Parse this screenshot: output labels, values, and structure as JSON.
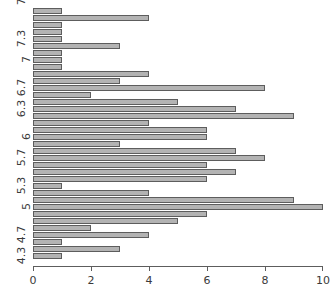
{
  "chart_data": {
    "type": "bar",
    "orientation": "horizontal",
    "title": "",
    "subtitle": "",
    "xlabel": "",
    "ylabel": "",
    "xlim": [
      0,
      10
    ],
    "ylim_labels": [
      "4.3",
      "4.7",
      "5",
      "5.3",
      "5.7",
      "6",
      "6.3",
      "6.7",
      "7",
      "7.3",
      "7.9"
    ],
    "grid": false,
    "legend": null,
    "bar_color": "#b3b3b3",
    "bar_border_color": "#5d5d5d",
    "axis_color": "#5d5d5d",
    "text_color": "#3a3a3a",
    "xticks": [
      0,
      2,
      4,
      6,
      8,
      10
    ],
    "xtick_labels": [
      "0",
      "2",
      "4",
      "6",
      "8",
      "10"
    ],
    "yticks": [
      {
        "label": "4.3",
        "bar_index": 1
      },
      {
        "label": "4.7",
        "bar_index": 4
      },
      {
        "label": "5",
        "bar_index": 8
      },
      {
        "label": "5.3",
        "bar_index": 11
      },
      {
        "label": "5.7",
        "bar_index": 15
      },
      {
        "label": "6",
        "bar_index": 18
      },
      {
        "label": "6.3",
        "bar_index": 22
      },
      {
        "label": "6.7",
        "bar_index": 25
      },
      {
        "label": "7",
        "bar_index": 29
      },
      {
        "label": "7.3",
        "bar_index": 32
      },
      {
        "label": "7.9",
        "bar_index": 38
      }
    ],
    "categories": [
      "4.3",
      "4.4",
      "4.5",
      "4.6",
      "4.7",
      "4.8",
      "4.9",
      "5.0",
      "5.1",
      "5.2",
      "5.3",
      "5.4",
      "5.5",
      "5.6",
      "5.7",
      "5.8",
      "5.9",
      "6.0",
      "6.1",
      "6.2",
      "6.3",
      "6.4",
      "6.5",
      "6.6",
      "6.7",
      "6.8",
      "6.9",
      "7.0",
      "7.1",
      "7.2",
      "7.3",
      "7.4",
      "7.6",
      "7.7",
      "7.9"
    ],
    "values_bottom_to_top": [
      1,
      3,
      1,
      4,
      2,
      5,
      6,
      10,
      9,
      4,
      1,
      6,
      7,
      6,
      8,
      7,
      3,
      6,
      6,
      4,
      9,
      7,
      5,
      2,
      8,
      3,
      4,
      1,
      1,
      3,
      1,
      1,
      1,
      4,
      1
    ],
    "values_top_to_bottom": [
      1,
      4,
      1,
      1,
      1,
      3,
      1,
      1,
      1,
      4,
      3,
      8,
      2,
      5,
      7,
      9,
      4,
      6,
      6,
      3,
      7,
      8,
      6,
      7,
      6,
      1,
      4,
      9,
      10,
      6,
      5,
      2,
      4,
      1,
      3,
      1
    ]
  }
}
